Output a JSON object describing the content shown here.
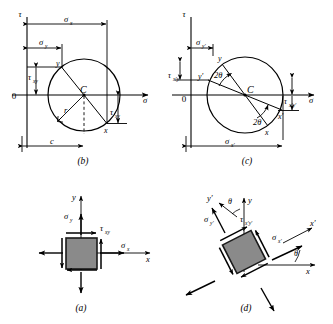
{
  "figure": {
    "title_caption_style": "lettered-panels",
    "panels": [
      {
        "id": "b",
        "caption": "(b)",
        "type": "mohr-circle",
        "axis_tau": "τ",
        "axis_sigma": "σ",
        "origin": "0",
        "center": "C",
        "radius_label": "r",
        "labels": {
          "sigma_x": "σ",
          "sigma_x_sub": "x",
          "sigma_y": "σ",
          "sigma_y_sub": "y",
          "tau_xy_left": "τ",
          "tau_xy_left_sub": "xy",
          "tau_xy_right": "τ",
          "tau_xy_right_sub": "xy",
          "point_x": "x",
          "point_y": "y",
          "c_dim": "c"
        }
      },
      {
        "id": "c",
        "caption": "(c)",
        "type": "mohr-circle-rotated",
        "axis_tau": "τ",
        "axis_sigma": "σ",
        "origin": "0",
        "center": "C",
        "labels": {
          "sigma_yp": "σ",
          "sigma_yp_sub": "y′",
          "tau_xpyp_left": "τ",
          "tau_xpyp_left_sub": "x′y′",
          "tau_xpyp_right": "τ",
          "tau_xpyp_right_sub": "x′y′",
          "point_x": "x",
          "point_y": "y",
          "point_xp": "x′",
          "point_yp": "y′",
          "two_theta_upper": "2θ",
          "two_theta_lower": "2θ",
          "sigma_xp_dim": "σ",
          "sigma_xp_dim_sub": "x′"
        }
      },
      {
        "id": "a",
        "caption": "(a)",
        "type": "stress-element",
        "labels": {
          "axis_x": "x",
          "axis_y": "y",
          "sigma_x": "σ",
          "sigma_x_sub": "x",
          "sigma_y": "σ",
          "sigma_y_sub": "y",
          "tau_xy": "τ",
          "tau_xy_sub": "xy"
        }
      },
      {
        "id": "d",
        "caption": "(d)",
        "type": "rotated-stress-element",
        "labels": {
          "axis_x": "x",
          "axis_y": "y",
          "axis_xp": "x′",
          "axis_yp": "y′",
          "theta_upper": "θ",
          "theta_lower": "θ",
          "sigma_xp": "σ",
          "sigma_xp_sub": "x′",
          "sigma_yp": "σ",
          "sigma_yp_sub": "y′",
          "tau_xpyp": "τ",
          "tau_xpyp_sub": "x′y′"
        }
      }
    ],
    "colors": {
      "stroke": "#000000",
      "element_fill": "#8a8a8a",
      "element_edge": "#1a1a1a",
      "background": "#ffffff"
    }
  }
}
